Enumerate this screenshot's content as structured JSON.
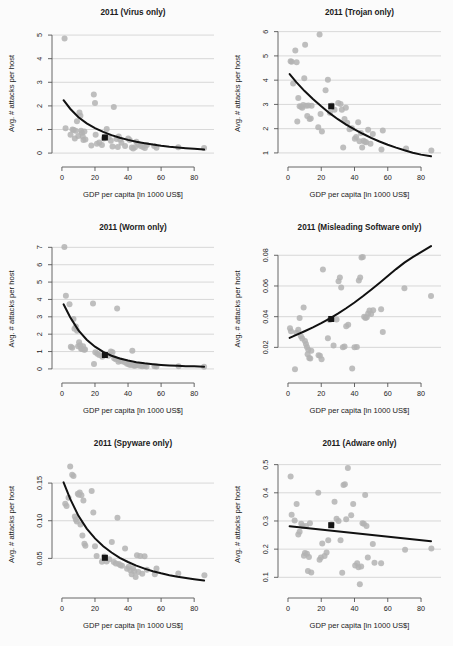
{
  "figure": {
    "name": "malware-attacks-vs-gdp-panels",
    "background_color": "#ffffff",
    "panel_background_color": "#fbfbfb",
    "scatter_color": "#b3b3b3",
    "curve_color": "#111111",
    "marker_color": "#141414",
    "gridline_color": "#c9c9c9",
    "axis_color": "#555555",
    "shared_xlabel": "GDP per capita [in 1000 US$]",
    "shared_ylabel": "Avg. # attacks per host",
    "shared_xticks": [
      0,
      20,
      40,
      60,
      80
    ],
    "shared_xlim": [
      -6,
      92
    ]
  },
  "chart_data": [
    {
      "type": "scatter",
      "panel_index": 0,
      "title": "2011 (Virus only)",
      "xlabel": "GDP per capita [in 1000 US$]",
      "ylabel": "Avg. # attacks per host",
      "xlim": [
        -6,
        92
      ],
      "ylim": [
        -0.25,
        5.3
      ],
      "xticks": [
        0,
        20,
        40,
        60,
        80
      ],
      "yticks": [
        0,
        1,
        2,
        3,
        4,
        5
      ],
      "ytick_labels": [
        "0",
        "1",
        "2",
        "3",
        "4",
        "5"
      ],
      "grid": true,
      "legend": "none",
      "x": [
        1.6,
        2.2,
        5.2,
        6.4,
        7.1,
        7.8,
        8.3,
        9.1,
        9.9,
        10.6,
        11.2,
        11.6,
        12.1,
        12.6,
        13.0,
        13.6,
        14.2,
        17.8,
        19.3,
        20.0,
        20.4,
        21.2,
        22.6,
        24.2,
        25.4,
        26.2,
        27.1,
        28.3,
        29.6,
        30.6,
        31.4,
        33.0,
        33.8,
        34.4,
        35.2,
        36.0,
        38.2,
        40.1,
        41.0,
        42.3,
        43.1,
        44.2,
        45.0,
        46.2,
        47.6,
        49.0,
        50.2,
        51.4,
        55.8,
        57.2,
        70.4,
        86.0
      ],
      "y": [
        4.85,
        1.05,
        0.78,
        1.0,
        0.98,
        0.62,
        0.95,
        1.35,
        0.72,
        1.72,
        1.58,
        0.95,
        0.86,
        0.7,
        0.55,
        0.92,
        0.58,
        0.32,
        2.48,
        2.12,
        0.78,
        0.4,
        0.45,
        0.34,
        0.62,
        0.7,
        1.02,
        0.68,
        0.52,
        0.28,
        1.95,
        0.6,
        0.26,
        0.7,
        0.58,
        0.44,
        0.3,
        0.62,
        0.55,
        0.24,
        0.2,
        0.25,
        0.48,
        0.38,
        0.3,
        0.26,
        0.22,
        0.34,
        0.3,
        0.23,
        0.25,
        0.22
      ],
      "highlight_point": {
        "x": 26.0,
        "y": 0.66,
        "shape": "square"
      },
      "fit": {
        "shape": "decay",
        "points_x": [
          1.0,
          5,
          10,
          15,
          20,
          25,
          30,
          35,
          40,
          45,
          50,
          55,
          60,
          65,
          70,
          75,
          80,
          86
        ],
        "points_y": [
          2.24,
          1.88,
          1.52,
          1.26,
          1.06,
          0.9,
          0.76,
          0.65,
          0.56,
          0.48,
          0.42,
          0.36,
          0.31,
          0.27,
          0.24,
          0.21,
          0.18,
          0.15
        ]
      }
    },
    {
      "type": "scatter",
      "panel_index": 1,
      "title": "2011 (Trojan only)",
      "xlabel": "GDP per capita [in 1000 US$]",
      "ylabel": "Avg. # attacks per host",
      "xlim": [
        -6,
        92
      ],
      "ylim": [
        0.75,
        6.15
      ],
      "xticks": [
        0,
        20,
        40,
        60,
        80
      ],
      "yticks": [
        1,
        2,
        3,
        4,
        5,
        6
      ],
      "ytick_labels": [
        "1",
        "2",
        "3",
        "4",
        "5",
        "6"
      ],
      "grid": true,
      "legend": "none",
      "x": [
        1.6,
        2.2,
        3.1,
        4.4,
        5.2,
        5.6,
        6.2,
        7.0,
        7.9,
        8.6,
        9.2,
        9.8,
        10.3,
        11.0,
        11.6,
        12.3,
        13.0,
        13.7,
        14.2,
        18.2,
        19.0,
        19.6,
        20.4,
        22.6,
        24.0,
        25.2,
        26.4,
        28.0,
        30.2,
        31.6,
        32.4,
        33.2,
        34.0,
        34.8,
        35.6,
        37.0,
        38.4,
        40.2,
        41.0,
        42.2,
        43.0,
        43.8,
        44.6,
        45.4,
        46.2,
        47.0,
        48.2,
        49.6,
        51.0,
        56.2,
        57.0,
        71.0,
        86.2
      ],
      "y": [
        4.78,
        4.76,
        3.86,
        5.22,
        4.74,
        2.3,
        3.26,
        2.92,
        2.9,
        2.86,
        2.98,
        4.08,
        5.46,
        2.94,
        2.52,
        2.96,
        2.4,
        2.42,
        2.95,
        2.06,
        5.88,
        2.6,
        1.88,
        3.58,
        4.02,
        2.66,
        2.96,
        2.78,
        3.06,
        3.02,
        2.78,
        1.22,
        2.4,
        2.86,
        2.24,
        1.98,
        2.02,
        1.58,
        1.66,
        2.26,
        1.48,
        1.82,
        1.22,
        1.5,
        1.46,
        1.44,
        1.96,
        1.38,
        1.78,
        1.14,
        1.92,
        1.18,
        1.1
      ],
      "highlight_point": {
        "x": 26.0,
        "y": 2.92,
        "shape": "square"
      },
      "fit": {
        "shape": "decay",
        "points_x": [
          1.0,
          5,
          10,
          15,
          20,
          25,
          30,
          35,
          40,
          45,
          50,
          55,
          60,
          65,
          70,
          75,
          80,
          86
        ],
        "points_y": [
          4.25,
          3.92,
          3.55,
          3.22,
          2.92,
          2.64,
          2.39,
          2.17,
          1.97,
          1.79,
          1.62,
          1.47,
          1.34,
          1.22,
          1.11,
          1.01,
          0.93,
          0.86
        ]
      }
    },
    {
      "type": "scatter",
      "panel_index": 2,
      "title": "2011 (Worm only)",
      "xlabel": "GDP per capita [in 1000 US$]",
      "ylabel": "Avg. # attacks per host",
      "xlim": [
        -6,
        92
      ],
      "ylim": [
        -0.35,
        7.25
      ],
      "xticks": [
        0,
        20,
        40,
        60,
        80
      ],
      "yticks": [
        0,
        1,
        2,
        3,
        4,
        5,
        6,
        7
      ],
      "ytick_labels": [
        "0",
        "1",
        "2",
        "3",
        "4",
        "5",
        "6",
        "7"
      ],
      "grid": true,
      "legend": "none",
      "x": [
        1.5,
        2.4,
        4.6,
        5.4,
        6.2,
        7.0,
        7.6,
        8.4,
        9.2,
        9.8,
        10.4,
        11.0,
        11.6,
        12.2,
        12.8,
        13.4,
        14.0,
        18.8,
        19.4,
        20.2,
        21.4,
        22.6,
        24.4,
        26.0,
        28.2,
        29.6,
        30.6,
        31.6,
        32.6,
        33.4,
        34.2,
        35.0,
        36.2,
        38.0,
        39.4,
        40.6,
        41.6,
        42.6,
        43.4,
        44.2,
        45.0,
        46.0,
        47.2,
        48.6,
        50.0,
        51.2,
        56.0,
        57.2,
        70.6,
        86.0
      ],
      "y": [
        7.02,
        4.22,
        3.72,
        1.28,
        1.22,
        2.88,
        2.32,
        2.44,
        2.2,
        1.3,
        1.54,
        1.36,
        1.16,
        1.14,
        1.3,
        1.1,
        1.12,
        3.76,
        0.28,
        0.96,
        0.88,
        0.8,
        0.7,
        0.8,
        0.76,
        1.0,
        0.96,
        0.62,
        0.56,
        3.48,
        0.42,
        0.5,
        0.44,
        0.38,
        0.3,
        0.26,
        0.22,
        1.04,
        0.2,
        0.18,
        0.24,
        0.22,
        0.18,
        0.16,
        0.18,
        0.14,
        0.16,
        0.14,
        0.16,
        0.12
      ],
      "highlight_point": {
        "x": 26.0,
        "y": 0.8,
        "shape": "square"
      },
      "fit": {
        "shape": "decay",
        "points_x": [
          1.0,
          5,
          10,
          15,
          20,
          25,
          30,
          35,
          40,
          45,
          50,
          55,
          60,
          65,
          70,
          75,
          80,
          86
        ],
        "points_y": [
          3.72,
          2.98,
          2.22,
          1.68,
          1.28,
          0.98,
          0.76,
          0.6,
          0.48,
          0.39,
          0.32,
          0.27,
          0.23,
          0.2,
          0.18,
          0.16,
          0.15,
          0.13
        ]
      }
    },
    {
      "type": "scatter",
      "panel_index": 3,
      "title": "2011 (Misleading Software only)",
      "xlabel": "GDP per capita [in 1000 US$]",
      "ylabel": "Avg. # attacks per host",
      "xlim": [
        -6,
        92
      ],
      "ylim": [
        0.002,
        0.088
      ],
      "xticks": [
        0,
        20,
        40,
        60,
        80
      ],
      "yticks": [
        0.02,
        0.04,
        0.06,
        0.08
      ],
      "ytick_labels": [
        "0.02",
        "0.04",
        "0.06",
        "0.08"
      ],
      "grid": true,
      "legend": "none",
      "x": [
        1.2,
        1.8,
        4.2,
        5.0,
        6.2,
        7.0,
        7.8,
        8.6,
        9.4,
        10.2,
        10.8,
        11.4,
        11.8,
        12.2,
        12.8,
        13.4,
        14.0,
        18.4,
        19.2,
        20.2,
        21.0,
        24.0,
        25.0,
        27.4,
        29.2,
        30.4,
        31.2,
        32.0,
        33.0,
        34.0,
        35.0,
        36.2,
        38.6,
        40.0,
        41.4,
        42.6,
        43.4,
        44.2,
        45.0,
        45.8,
        46.6,
        47.4,
        48.2,
        49.0,
        50.0,
        51.2,
        56.0,
        57.0,
        70.0,
        86.0
      ],
      "y": [
        0.0325,
        0.0305,
        0.0058,
        0.0295,
        0.0315,
        0.0392,
        0.0272,
        0.0258,
        0.046,
        0.0242,
        0.0222,
        0.0202,
        0.0155,
        0.0185,
        0.013,
        0.0128,
        0.0178,
        0.0148,
        0.0145,
        0.0122,
        0.0708,
        0.026,
        0.0378,
        0.0212,
        0.0382,
        0.063,
        0.0655,
        0.059,
        0.02,
        0.0205,
        0.0338,
        0.0348,
        0.0062,
        0.02,
        0.0202,
        0.0635,
        0.0656,
        0.0785,
        0.0788,
        0.04,
        0.0392,
        0.0396,
        0.042,
        0.044,
        0.0418,
        0.0442,
        0.0448,
        0.03,
        0.0585,
        0.0535
      ],
      "highlight_point": {
        "x": 26.0,
        "y": 0.0385,
        "shape": "square"
      },
      "fit": {
        "shape": "growth",
        "points_x": [
          1.0,
          5,
          10,
          15,
          20,
          25,
          30,
          35,
          40,
          45,
          50,
          55,
          60,
          65,
          70,
          75,
          80,
          86
        ],
        "points_y": [
          0.0262,
          0.0281,
          0.0305,
          0.033,
          0.0358,
          0.0388,
          0.042,
          0.0455,
          0.0492,
          0.0533,
          0.0576,
          0.062,
          0.0665,
          0.071,
          0.0752,
          0.0788,
          0.082,
          0.086
        ]
      }
    },
    {
      "type": "scatter",
      "panel_index": 4,
      "title": "2011 (Spyware only)",
      "xlabel": "GDP per capita [in 1000 US$]",
      "ylabel": "Avg. # attacks per host",
      "xlim": [
        -6,
        92
      ],
      "ylim": [
        0.008,
        0.182
      ],
      "xticks": [
        0,
        20,
        40,
        60,
        80
      ],
      "yticks": [
        0.05,
        0.1,
        0.15
      ],
      "ytick_labels": [
        "0.05",
        "0.10",
        "0.15"
      ],
      "grid": true,
      "legend": "none",
      "x": [
        2.0,
        2.8,
        4.0,
        5.0,
        6.2,
        7.0,
        7.8,
        8.4,
        9.0,
        9.6,
        10.2,
        10.8,
        11.2,
        11.8,
        12.4,
        13.0,
        13.6,
        14.2,
        18.0,
        19.0,
        20.0,
        21.0,
        24.2,
        25.6,
        27.0,
        28.6,
        30.2,
        31.4,
        32.6,
        33.6,
        34.4,
        35.4,
        36.4,
        38.2,
        39.4,
        40.4,
        41.4,
        42.2,
        43.0,
        43.8,
        44.6,
        45.4,
        46.2,
        47.4,
        48.6,
        50.0,
        51.4,
        56.2,
        57.2,
        70.4,
        86.2
      ],
      "y": [
        0.1225,
        0.1195,
        0.1305,
        0.172,
        0.161,
        0.1595,
        0.1055,
        0.1015,
        0.099,
        0.136,
        0.1345,
        0.1375,
        0.095,
        0.134,
        0.0805,
        0.127,
        0.0695,
        0.0668,
        0.1395,
        0.111,
        0.066,
        0.053,
        0.0455,
        0.0525,
        0.0458,
        0.049,
        0.0718,
        0.0452,
        0.0432,
        0.104,
        0.0424,
        0.0408,
        0.0402,
        0.063,
        0.0362,
        0.039,
        0.0342,
        0.0288,
        0.037,
        0.033,
        0.0252,
        0.054,
        0.0318,
        0.053,
        0.0295,
        0.0528,
        0.0348,
        0.0288,
        0.0365,
        0.0298,
        0.0275
      ],
      "highlight_point": {
        "x": 26.0,
        "y": 0.0508,
        "shape": "square"
      },
      "fit": {
        "shape": "decay",
        "points_x": [
          1.0,
          5,
          10,
          15,
          20,
          25,
          30,
          35,
          40,
          45,
          50,
          55,
          60,
          65,
          70,
          75,
          80,
          86
        ],
        "points_y": [
          0.151,
          0.129,
          0.1065,
          0.0895,
          0.0765,
          0.0662,
          0.0578,
          0.0508,
          0.0452,
          0.0404,
          0.0364,
          0.033,
          0.0302,
          0.0277,
          0.0256,
          0.0238,
          0.0222,
          0.0205
        ]
      }
    },
    {
      "type": "scatter",
      "panel_index": 5,
      "title": "2011 (Adware only)",
      "xlabel": "GDP per capita [in 1000 US$]",
      "ylabel": "Avg. # attacks per host",
      "xlim": [
        -6,
        92
      ],
      "ylim": [
        0.055,
        0.52
      ],
      "xticks": [
        0,
        20,
        40,
        60,
        80
      ],
      "yticks": [
        0.1,
        0.2,
        0.3,
        0.4,
        0.5
      ],
      "ytick_labels": [
        "0.1",
        "0.2",
        "0.3",
        "0.4",
        "0.5"
      ],
      "grid": true,
      "legend": "none",
      "x": [
        1.6,
        2.2,
        4.0,
        5.2,
        6.2,
        7.0,
        8.0,
        8.8,
        9.6,
        10.2,
        10.8,
        11.4,
        12.0,
        12.6,
        13.2,
        14.0,
        18.2,
        19.0,
        19.8,
        20.6,
        22.0,
        23.2,
        24.2,
        26.2,
        28.0,
        29.2,
        30.4,
        31.6,
        32.6,
        33.4,
        34.2,
        35.0,
        36.0,
        38.0,
        39.2,
        40.4,
        41.6,
        42.4,
        43.2,
        44.0,
        44.8,
        45.6,
        46.4,
        47.2,
        48.0,
        51.0,
        52.0,
        56.0,
        70.4,
        86.2
      ],
      "y": [
        0.458,
        0.322,
        0.302,
        0.36,
        0.252,
        0.262,
        0.29,
        0.282,
        0.177,
        0.186,
        0.282,
        0.184,
        0.122,
        0.172,
        0.292,
        0.117,
        0.4,
        0.162,
        0.17,
        0.22,
        0.176,
        0.188,
        0.232,
        0.288,
        0.368,
        0.308,
        0.3,
        0.232,
        0.116,
        0.428,
        0.43,
        0.306,
        0.488,
        0.32,
        0.36,
        0.142,
        0.15,
        0.136,
        0.075,
        0.138,
        0.292,
        0.29,
        0.392,
        0.282,
        0.17,
        0.218,
        0.152,
        0.15,
        0.198,
        0.202
      ],
      "highlight_point": {
        "x": 26.0,
        "y": 0.285,
        "shape": "square"
      },
      "fit": {
        "shape": "linear",
        "points_x": [
          1.0,
          86.0
        ],
        "points_y": [
          0.281,
          0.228
        ]
      }
    }
  ]
}
